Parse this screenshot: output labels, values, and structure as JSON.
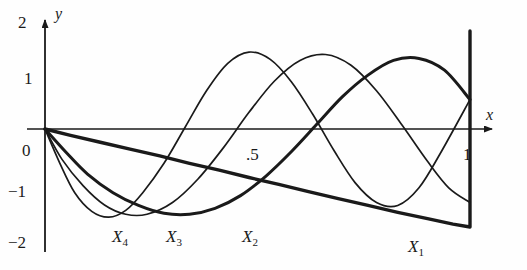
{
  "figure": {
    "kind": "line-plot",
    "background": "#fefefe",
    "ink": "#1a1a1a"
  },
  "axes": {
    "x_label": "x",
    "y_label": "y",
    "x_ticks": [
      {
        "text": ".5",
        "value": 0.5
      },
      {
        "text": "1",
        "value": 1.0
      }
    ],
    "y_ticks": [
      {
        "text": "2",
        "value": 2
      },
      {
        "text": "1",
        "value": 1
      },
      {
        "text": "0",
        "value": 0
      },
      {
        "text": "−1",
        "value": -1
      },
      {
        "text": "−2",
        "value": -2
      }
    ]
  },
  "curve_labels": [
    {
      "base": "X",
      "sub": "4"
    },
    {
      "base": "X",
      "sub": "3"
    },
    {
      "base": "X",
      "sub": "2"
    },
    {
      "base": "X",
      "sub": "1"
    }
  ],
  "chart_data": {
    "type": "line",
    "title": "",
    "xlabel": "x",
    "ylabel": "y",
    "xlim": [
      0,
      1.08
    ],
    "ylim": [
      -2,
      2
    ],
    "grid": false,
    "legend": "inline-curve-labels",
    "x_tick_values": [
      0.5,
      1.0
    ],
    "x_tick_labels": [
      ".5",
      "1"
    ],
    "y_tick_values": [
      2,
      1,
      0,
      -1,
      -2
    ],
    "y_tick_labels": [
      "2",
      "1",
      "0",
      "−1",
      "−2"
    ],
    "series": [
      {
        "name": "X1",
        "label": "X₁",
        "stroke_width": 3.4,
        "label_x": 0.88,
        "label_y": -2.45,
        "x": [
          0,
          0.06,
          0.13,
          0.2,
          0.27,
          0.34,
          0.41,
          0.48,
          0.55,
          0.62,
          0.69,
          0.76,
          0.83,
          0.9,
          0.96,
          1.0,
          1.0
        ],
        "y": [
          0,
          -0.13,
          -0.27,
          -0.41,
          -0.55,
          -0.7,
          -0.84,
          -0.99,
          -1.13,
          -1.28,
          -1.42,
          -1.56,
          -1.7,
          -1.83,
          -1.94,
          -2.0,
          2.0
        ]
      },
      {
        "name": "X2",
        "label": "X₂",
        "stroke_width": 3.0,
        "label_x": 0.5,
        "label_y": -2.45,
        "x": [
          0,
          0.05,
          0.1,
          0.16,
          0.22,
          0.28,
          0.34,
          0.4,
          0.46,
          0.52,
          0.58,
          0.64,
          0.7,
          0.76,
          0.82,
          0.88,
          0.94,
          1.0
        ],
        "y": [
          0,
          -0.48,
          -0.92,
          -1.3,
          -1.56,
          -1.72,
          -1.74,
          -1.62,
          -1.36,
          -0.96,
          -0.46,
          0.1,
          0.66,
          1.1,
          1.4,
          1.44,
          1.2,
          0.6
        ]
      },
      {
        "name": "X3",
        "label": "X₃",
        "stroke_width": 1.7,
        "label_x": 0.33,
        "label_y": -2.45,
        "x": [
          0,
          0.04,
          0.09,
          0.14,
          0.19,
          0.24,
          0.3,
          0.36,
          0.42,
          0.48,
          0.54,
          0.6,
          0.66,
          0.72,
          0.78,
          0.84,
          0.9,
          0.95,
          1.0
        ],
        "y": [
          0,
          -0.62,
          -1.16,
          -1.55,
          -1.74,
          -1.74,
          -1.5,
          -1.02,
          -0.38,
          0.34,
          0.98,
          1.4,
          1.52,
          1.3,
          0.78,
          0.08,
          -0.66,
          -1.2,
          -1.5
        ]
      },
      {
        "name": "X4",
        "label": "X₄",
        "stroke_width": 1.7,
        "label_x": 0.175,
        "label_y": -2.45,
        "x": [
          0,
          0.035,
          0.07,
          0.11,
          0.15,
          0.19,
          0.23,
          0.28,
          0.33,
          0.38,
          0.43,
          0.48,
          0.53,
          0.58,
          0.63,
          0.68,
          0.73,
          0.78,
          0.83,
          0.88,
          0.93,
          1.0
        ],
        "y": [
          0,
          -0.7,
          -1.3,
          -1.68,
          -1.8,
          -1.66,
          -1.3,
          -0.7,
          0.04,
          0.78,
          1.34,
          1.57,
          1.42,
          0.96,
          0.3,
          -0.44,
          -1.1,
          -1.5,
          -1.56,
          -1.2,
          -0.5,
          0.6
        ]
      }
    ]
  },
  "label_positions": {
    "y_axis_name": {
      "x": 55,
      "y": 6
    },
    "x_axis_name": {
      "x": 486,
      "y": 107
    },
    "tick_2": {
      "x": 18,
      "y": 14
    },
    "tick_1": {
      "x": 24,
      "y": 70
    },
    "tick_0": {
      "x": 22,
      "y": 142
    },
    "tick_m1": {
      "x": 8,
      "y": 183
    },
    "tick_m2": {
      "x": 8,
      "y": 234
    },
    "tick_half": {
      "x": 246,
      "y": 146
    },
    "tick_one": {
      "x": 463,
      "y": 146
    },
    "x4": {
      "x": 112,
      "y": 228
    },
    "x3": {
      "x": 166,
      "y": 228
    },
    "x2": {
      "x": 242,
      "y": 228
    },
    "x1": {
      "x": 408,
      "y": 238
    }
  }
}
